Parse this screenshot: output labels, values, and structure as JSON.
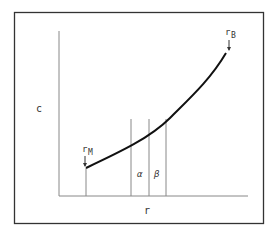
{
  "diagram": {
    "y_axis_label": "c",
    "x_axis_label": "r",
    "curve_start_label": {
      "main": "r",
      "sub": "M"
    },
    "curve_end_label": {
      "main": "r",
      "sub": "B"
    },
    "region_labels": [
      "α",
      "β"
    ],
    "colors": {
      "frame": "#333333",
      "axis": "#888888",
      "curve": "#111111",
      "text": "#333333"
    }
  }
}
